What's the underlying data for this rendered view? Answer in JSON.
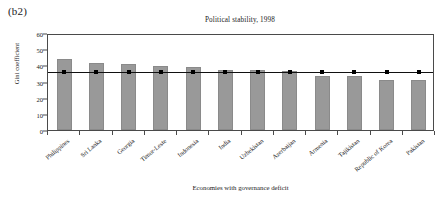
{
  "panel": {
    "label": "(b2)"
  },
  "chart_data": {
    "type": "bar",
    "title": "Political stability, 1998",
    "xlabel": "Economies with governance deficit",
    "ylabel": "Gini coefficient",
    "categories": [
      "Philippines",
      "Sri Lanka",
      "Georgia",
      "Timor-Leste",
      "Indonesia",
      "India",
      "Uzbekistan",
      "Azerbaijan",
      "Armenia",
      "Tajikistan",
      "Republic of Korea",
      "Pakistan"
    ],
    "values": [
      44.0,
      41.2,
      40.6,
      39.3,
      38.8,
      37.0,
      36.9,
      36.2,
      33.3,
      33.2,
      31.2,
      30.8
    ],
    "series": [
      {
        "name": "Gini coefficient",
        "type": "bar",
        "values": [
          44.0,
          41.2,
          40.6,
          39.3,
          38.8,
          37.0,
          36.9,
          36.2,
          33.3,
          33.2,
          31.2,
          30.8
        ]
      },
      {
        "name": "Reference line",
        "type": "line",
        "values": [
          37.0,
          37.0,
          37.0,
          37.0,
          37.0,
          37.0,
          37.0,
          37.0,
          37.0,
          37.0,
          37.0,
          37.0
        ]
      }
    ],
    "ylim": [
      0,
      60
    ],
    "yticks": [
      0,
      10,
      20,
      30,
      40,
      50,
      60
    ],
    "ytick_labels": [
      "0",
      "10",
      "20",
      "30",
      "40",
      "50",
      "60"
    ],
    "grid": false,
    "legend": "none",
    "bar_color": "#999999",
    "line_color": "#111111",
    "marker_color": "#000000"
  }
}
